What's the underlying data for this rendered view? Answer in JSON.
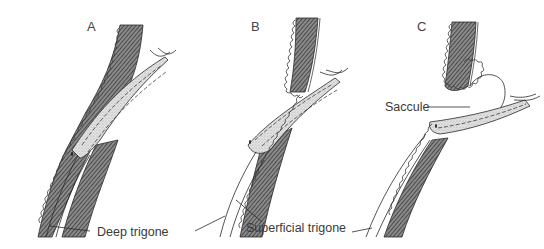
{
  "figure": {
    "panels": [
      {
        "id": "A",
        "letter": "A"
      },
      {
        "id": "B",
        "letter": "B"
      },
      {
        "id": "C",
        "letter": "C"
      }
    ],
    "labels": {
      "deep_trigone": "Deep trigone",
      "superficial_trigone": "Superficial trigone",
      "saccule": "Saccule"
    },
    "colors": {
      "muscle_hatch": "#5a5a5a",
      "stipple": "#cfcfcf",
      "outline": "#2a2a2a",
      "text": "#3a3a3a",
      "background": "#ffffff"
    }
  }
}
